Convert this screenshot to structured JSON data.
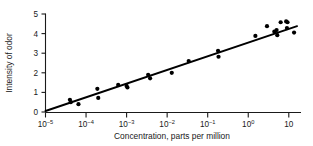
{
  "chart_data": {
    "type": "scatter",
    "title": "",
    "xlabel": "Concentration, parts per million",
    "ylabel": "Intensity of odor",
    "xscale": "log",
    "yscale": "linear",
    "xlim": [
      1e-05,
      20
    ],
    "ylim": [
      0,
      5.3
    ],
    "grid": false,
    "legend": null,
    "xticks": [
      1e-05,
      0.0001,
      0.001,
      0.01,
      0.1,
      1,
      10
    ],
    "xticklabels": [
      "10⁻⁵",
      "10⁻⁴",
      "10⁻³",
      "10⁻²",
      "10⁻¹",
      "10⁰",
      "10"
    ],
    "xtick_mantissa": [
      "10",
      "10",
      "10",
      "10",
      "10",
      "10",
      "10"
    ],
    "xtick_exponent": [
      "-5",
      "-4",
      "-3",
      "-2",
      "-1",
      "0",
      ""
    ],
    "yticks": [
      0,
      1,
      2,
      3,
      4,
      5
    ],
    "yticklabels": [
      "0",
      "1",
      "2",
      "3",
      "4",
      "5"
    ],
    "series": [
      {
        "name": "odor intensity observations",
        "marker": "filled-circle",
        "color": "#000000",
        "points": [
          {
            "x": 4e-05,
            "y": 0.62
          },
          {
            "x": 4.2e-05,
            "y": 0.5
          },
          {
            "x": 6.5e-05,
            "y": 0.4
          },
          {
            "x": 0.00019,
            "y": 1.18
          },
          {
            "x": 0.0002,
            "y": 0.72
          },
          {
            "x": 0.00062,
            "y": 1.38
          },
          {
            "x": 0.001,
            "y": 1.33
          },
          {
            "x": 0.00105,
            "y": 1.25
          },
          {
            "x": 0.0034,
            "y": 1.9
          },
          {
            "x": 0.0038,
            "y": 1.72
          },
          {
            "x": 0.013,
            "y": 2.0
          },
          {
            "x": 0.034,
            "y": 2.6
          },
          {
            "x": 0.18,
            "y": 3.12
          },
          {
            "x": 0.185,
            "y": 2.82
          },
          {
            "x": 1.5,
            "y": 3.88
          },
          {
            "x": 2.9,
            "y": 4.38
          },
          {
            "x": 4.4,
            "y": 4.1
          },
          {
            "x": 5.0,
            "y": 4.18
          },
          {
            "x": 5.2,
            "y": 3.92
          },
          {
            "x": 6.3,
            "y": 4.58
          },
          {
            "x": 8.6,
            "y": 4.62
          },
          {
            "x": 9.0,
            "y": 4.28
          },
          {
            "x": 9.3,
            "y": 4.58
          },
          {
            "x": 13.5,
            "y": 4.05
          }
        ]
      }
    ],
    "fit_line": {
      "name": "fitted regression line",
      "color": "#000000",
      "endpoints": [
        {
          "x": 1e-05,
          "y": 0.05
        },
        {
          "x": 16.0,
          "y": 4.38
        }
      ]
    }
  }
}
